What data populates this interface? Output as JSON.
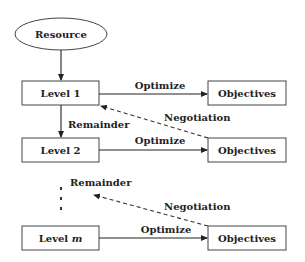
{
  "diagram": {
    "type": "flowchart",
    "nodes": {
      "resource": {
        "label": "Resource",
        "shape": "ellipse"
      },
      "level1": {
        "label": "Level 1",
        "shape": "rect"
      },
      "level2": {
        "label": "Level 2",
        "shape": "rect"
      },
      "levelm_prefix": "Level ",
      "levelm_var": "m",
      "objectives1": {
        "label": "Objectives",
        "shape": "rect"
      },
      "objectives2": {
        "label": "Objectives",
        "shape": "rect"
      },
      "objectivesm": {
        "label": "Objectives",
        "shape": "rect"
      }
    },
    "edges": {
      "optimize1": "Optimize",
      "optimize2": "Optimize",
      "optimizem": "Optimize",
      "negotiation1": "Negotiation",
      "negotiationm": "Negotiation",
      "remainder1": "Remainder",
      "remainder2": "Remainder"
    },
    "colors": {
      "stroke": "#444444",
      "text": "#222222",
      "background": "#ffffff"
    }
  }
}
